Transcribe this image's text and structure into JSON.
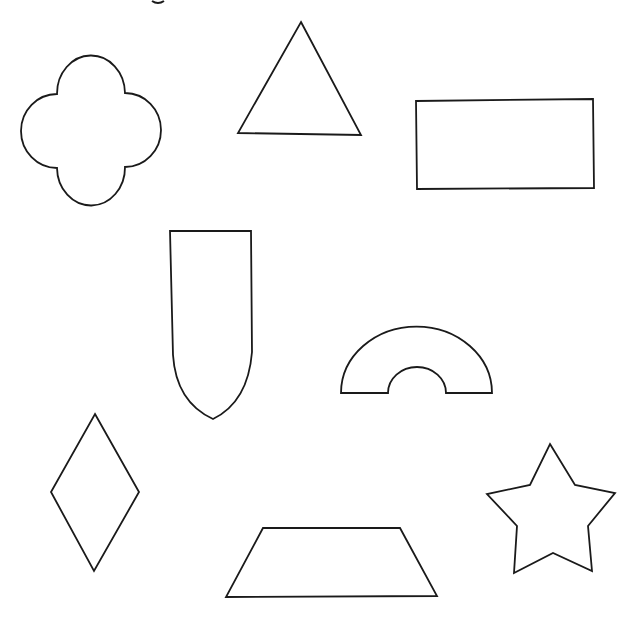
{
  "worksheet": {
    "description": "Outline shapes worksheet",
    "stroke_color": "#1a1a1a",
    "background_color": "#ffffff",
    "cropped_text_fragment": "g",
    "shapes": [
      {
        "id": "quatrefoil",
        "name": "Quatrefoil (four-lobed flower)"
      },
      {
        "id": "triangle",
        "name": "Triangle"
      },
      {
        "id": "rectangle",
        "name": "Rectangle"
      },
      {
        "id": "shield",
        "name": "Pointed arch / shield"
      },
      {
        "id": "semicircle-arch",
        "name": "Half-ring arch"
      },
      {
        "id": "rhombus",
        "name": "Rhombus / diamond"
      },
      {
        "id": "trapezoid",
        "name": "Trapezoid"
      },
      {
        "id": "star",
        "name": "Five-pointed star"
      }
    ]
  }
}
